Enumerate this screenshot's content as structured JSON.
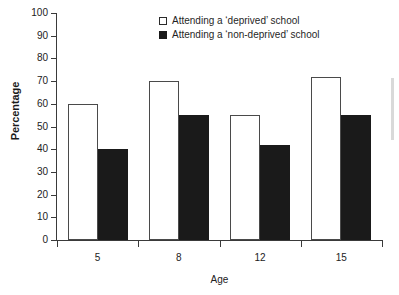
{
  "chart_data": {
    "type": "bar",
    "title": "",
    "subtitle": "",
    "xlabel": "Age",
    "ylabel": "Percentage",
    "categories": [
      "5",
      "8",
      "12",
      "15"
    ],
    "series": [
      {
        "name": "Attending a ‘deprived’ school",
        "values": [
          60,
          70,
          55,
          72
        ],
        "color": "#ffffff",
        "edge_color": "#4a4a4a"
      },
      {
        "name": "Attending a ‘non-deprived’ school",
        "values": [
          40,
          55,
          42,
          55
        ],
        "color": "#1a1a1a",
        "edge_color": "#1a1a1a"
      }
    ],
    "ylim": [
      0,
      100
    ],
    "yticks": [
      0,
      10,
      20,
      30,
      40,
      50,
      60,
      70,
      80,
      90,
      100
    ],
    "ytick_labels": [
      "0",
      "10",
      "20",
      "30",
      "40",
      "50",
      "60",
      "70",
      "80",
      "90",
      "100"
    ],
    "grid": false,
    "legend_position": "top-center"
  },
  "legend": {
    "items": [
      {
        "label": "Attending a ‘deprived’ school",
        "swatch": "white-square-icon"
      },
      {
        "label": "Attending a ‘non-deprived’ school",
        "swatch": "black-square-icon"
      }
    ]
  },
  "axes": {
    "y_title": "Percentage",
    "x_title": "Age"
  }
}
